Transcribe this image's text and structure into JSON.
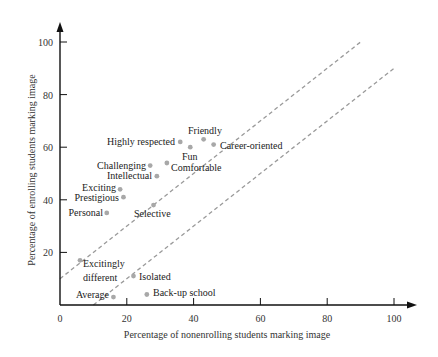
{
  "chart_data": {
    "type": "scatter",
    "title": "",
    "xlabel": "Percentage of nonenrolling students marking image",
    "ylabel": "Percentage of enrolling students marking image",
    "xlim": [
      0,
      100
    ],
    "ylim": [
      0,
      100
    ],
    "xticks": [
      0,
      20,
      40,
      60,
      80,
      100
    ],
    "yticks": [
      20,
      40,
      60,
      80,
      100
    ],
    "grid": false,
    "legend": null,
    "points": [
      {
        "label": "Friendly",
        "x": 43,
        "y": 63
      },
      {
        "label": "Career-oriented",
        "x": 46,
        "y": 61
      },
      {
        "label": "Highly respected",
        "x": 36,
        "y": 62
      },
      {
        "label": "Fun",
        "x": 39,
        "y": 60
      },
      {
        "label": "Comfortable",
        "x": 32,
        "y": 54
      },
      {
        "label": "Challenging",
        "x": 27,
        "y": 53
      },
      {
        "label": "Intellectual",
        "x": 29,
        "y": 49
      },
      {
        "label": "Exciting",
        "x": 18,
        "y": 44
      },
      {
        "label": "Prestigious",
        "x": 19,
        "y": 41
      },
      {
        "label": "Personal",
        "x": 14,
        "y": 35
      },
      {
        "label": "Selective",
        "x": 28,
        "y": 38
      },
      {
        "label": "Excitingly different",
        "x": 6,
        "y": 17
      },
      {
        "label": "Isolated",
        "x": 22,
        "y": 11
      },
      {
        "label": "Average",
        "x": 16,
        "y": 3
      },
      {
        "label": "Back-up school",
        "x": 26,
        "y": 4
      }
    ],
    "reference_lines": [
      {
        "name": "upper-boundary",
        "style": "dashed",
        "from": [
          0,
          10
        ],
        "to": [
          90,
          100
        ]
      },
      {
        "name": "lower-boundary",
        "style": "dashed",
        "from": [
          10,
          0
        ],
        "to": [
          100,
          90
        ]
      }
    ]
  },
  "axes": {
    "x_tick_labels": [
      "0",
      "20",
      "40",
      "60",
      "80",
      "100"
    ],
    "y_tick_labels": [
      "20",
      "40",
      "60",
      "80",
      "100"
    ]
  },
  "labels": {
    "friendly": "Friendly",
    "career_oriented": "Career-oriented",
    "highly_respected": "Highly respected",
    "fun": "Fun",
    "comfortable": "Comfortable",
    "challenging": "Challenging",
    "intellectual": "Intellectual",
    "exciting": "Exciting",
    "prestigious": "Prestigious",
    "personal": "Personal",
    "selective": "Selective",
    "excitingly_line1": "Excitingly",
    "excitingly_line2": "different",
    "isolated": "Isolated",
    "average": "Average",
    "backup_school": "Back-up school"
  },
  "colors": {
    "axis": "#111111",
    "point": "#a8a8a8",
    "reference_line": "#9a9a9a",
    "text": "#222222"
  }
}
